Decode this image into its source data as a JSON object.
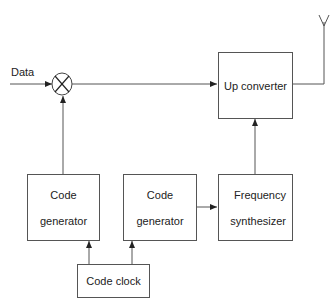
{
  "diagram": {
    "type": "block-diagram",
    "title": "",
    "input_label": "Data",
    "mixer": {
      "symbol": "multiplier-x"
    },
    "blocks": {
      "up_converter": {
        "line1": "Up converter"
      },
      "code_generator_1": {
        "line1": "Code",
        "line2": "generator"
      },
      "code_generator_2": {
        "line1": "Code",
        "line2": "generator"
      },
      "frequency_synthesizer": {
        "line1": "Frequency",
        "line2": "synthesizer"
      },
      "code_clock": {
        "line1": "Code clock"
      }
    },
    "antenna": {
      "symbol": "antenna-icon"
    },
    "edges": [
      {
        "from": "Data",
        "to": "mixer"
      },
      {
        "from": "code_generator_1",
        "to": "mixer"
      },
      {
        "from": "mixer",
        "to": "up_converter"
      },
      {
        "from": "up_converter",
        "to": "antenna"
      },
      {
        "from": "frequency_synthesizer",
        "to": "up_converter"
      },
      {
        "from": "code_generator_2",
        "to": "frequency_synthesizer"
      },
      {
        "from": "code_clock",
        "to": "code_generator_1"
      },
      {
        "from": "code_clock",
        "to": "code_generator_2"
      }
    ],
    "colors": {
      "line": "#555555",
      "text": "#222222",
      "background": "#ffffff"
    }
  }
}
